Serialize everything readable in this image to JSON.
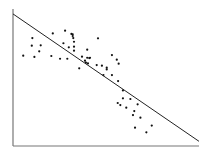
{
  "chart_data": {
    "type": "scatter",
    "title": "",
    "xlabel": "",
    "ylabel": "",
    "xlim": [
      0,
      100
    ],
    "ylim": [
      0,
      100
    ],
    "grid": false,
    "legend": null,
    "tick_labels": false,
    "colors": {
      "axis": "#777777",
      "points": "#111111",
      "trend_line": "#222222",
      "background": "#ffffff"
    },
    "points": [
      {
        "x": 5.5,
        "y": 65.9
      },
      {
        "x": 10.4,
        "y": 78.8
      },
      {
        "x": 10.1,
        "y": 73.2
      },
      {
        "x": 11.5,
        "y": 65.0
      },
      {
        "x": 14.9,
        "y": 73.5
      },
      {
        "x": 14.1,
        "y": 69.1
      },
      {
        "x": 21.4,
        "y": 82.2
      },
      {
        "x": 20.6,
        "y": 65.7
      },
      {
        "x": 25.3,
        "y": 63.7
      },
      {
        "x": 27.1,
        "y": 75.0
      },
      {
        "x": 28.0,
        "y": 84.2
      },
      {
        "x": 30.0,
        "y": 72.0
      },
      {
        "x": 29.2,
        "y": 63.7
      },
      {
        "x": 31.4,
        "y": 81.8
      },
      {
        "x": 32.1,
        "y": 81.5
      },
      {
        "x": 32.1,
        "y": 80.3
      },
      {
        "x": 32.8,
        "y": 76.1
      },
      {
        "x": 32.8,
        "y": 72.5
      },
      {
        "x": 32.8,
        "y": 69.6
      },
      {
        "x": 32.4,
        "y": 78.8
      },
      {
        "x": 37.1,
        "y": 65.2
      },
      {
        "x": 35.6,
        "y": 56.7
      },
      {
        "x": 38.7,
        "y": 62.3
      },
      {
        "x": 39.2,
        "y": 60.8
      },
      {
        "x": 39.9,
        "y": 70.3
      },
      {
        "x": 39.9,
        "y": 64.4
      },
      {
        "x": 41.0,
        "y": 64.2
      },
      {
        "x": 41.4,
        "y": 64.4
      },
      {
        "x": 40.3,
        "y": 60.3
      },
      {
        "x": 45.0,
        "y": 59.1
      },
      {
        "x": 45.7,
        "y": 78.6
      },
      {
        "x": 47.8,
        "y": 58.6
      },
      {
        "x": 50.4,
        "y": 57.2
      },
      {
        "x": 50.4,
        "y": 55.9
      },
      {
        "x": 48.6,
        "y": 51.8
      },
      {
        "x": 53.2,
        "y": 66.4
      },
      {
        "x": 55.8,
        "y": 63.0
      },
      {
        "x": 56.8,
        "y": 60.1
      },
      {
        "x": 53.2,
        "y": 51.8
      },
      {
        "x": 56.5,
        "y": 47.4
      },
      {
        "x": 59.1,
        "y": 40.6
      },
      {
        "x": 59.1,
        "y": 34.8
      },
      {
        "x": 63.1,
        "y": 34.3
      },
      {
        "x": 56.3,
        "y": 31.4
      },
      {
        "x": 57.7,
        "y": 29.9
      },
      {
        "x": 60.9,
        "y": 28.0
      },
      {
        "x": 67.0,
        "y": 30.4
      },
      {
        "x": 65.2,
        "y": 25.5
      },
      {
        "x": 64.5,
        "y": 22.6
      },
      {
        "x": 68.5,
        "y": 20.7
      },
      {
        "x": 65.6,
        "y": 13.4
      },
      {
        "x": 74.6,
        "y": 14.9
      },
      {
        "x": 71.7,
        "y": 10.0
      }
    ],
    "trend_line": {
      "x1": 0,
      "y1": 96.4,
      "x2": 100,
      "y2": 3.4
    },
    "plot_box_px": {
      "left": 13,
      "right": 199,
      "top": 9,
      "bottom": 146
    }
  }
}
